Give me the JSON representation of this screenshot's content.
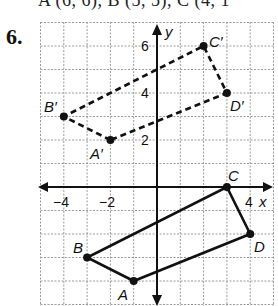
{
  "header": {
    "clipped_text": "A (6, 6), B (5, 5), C (4, 1",
    "problem_number": "6."
  },
  "graph": {
    "axis_labels": {
      "x": "x",
      "y": "y"
    },
    "x_ticks": [
      {
        "value": -4,
        "label": "−4"
      },
      {
        "value": -2,
        "label": "−2"
      },
      {
        "value": 4,
        "label": "4"
      }
    ],
    "y_ticks": [
      {
        "value": 6,
        "label": "6"
      },
      {
        "value": 4,
        "label": "4"
      },
      {
        "value": 2,
        "label": "2"
      }
    ],
    "original_figure": {
      "style": "solid",
      "vertices": [
        {
          "name": "A",
          "x": -1,
          "y": -4
        },
        {
          "name": "B",
          "x": -3,
          "y": -3
        },
        {
          "name": "C",
          "x": 3,
          "y": 0
        },
        {
          "name": "D",
          "x": 4,
          "y": -2
        }
      ]
    },
    "image_figure": {
      "style": "dashed",
      "vertices": [
        {
          "name": "A′",
          "x": -2,
          "y": 2
        },
        {
          "name": "B′",
          "x": -4,
          "y": 3
        },
        {
          "name": "C′",
          "x": 2,
          "y": 6
        },
        {
          "name": "D′",
          "x": 3,
          "y": 4
        }
      ]
    },
    "colors": {
      "grid": "#9a9a9a",
      "axes": "#111111",
      "figure": "#111111"
    }
  }
}
